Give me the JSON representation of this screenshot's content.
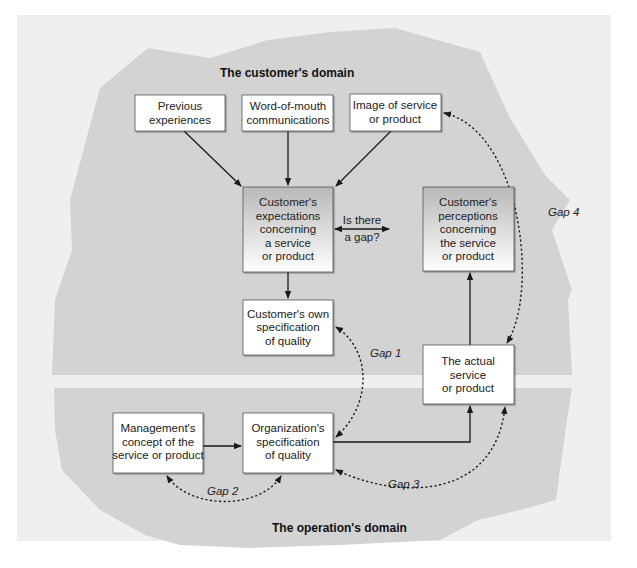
{
  "colors": {
    "page_background": "#ffffff",
    "panel_background": "#efefef",
    "domain_fill": "#d3d3d3",
    "separator": "#eaeaea",
    "box_fill": "#ffffff",
    "box_border": "#555555",
    "box_gradient_top": "#b9b9b9",
    "box_gradient_bottom": "#ffffff",
    "arrow": "#1a1a1a"
  },
  "domains": {
    "customer": {
      "title": "The customer's domain"
    },
    "operation": {
      "title": "The operation's domain"
    }
  },
  "boxes": {
    "previous_experiences": {
      "lines": [
        "Previous",
        "experiences"
      ]
    },
    "word_of_mouth": {
      "lines": [
        "Word-of-mouth",
        "communications"
      ]
    },
    "image_of_service": {
      "lines": [
        "Image of service",
        "or product"
      ]
    },
    "customer_expectations": {
      "lines": [
        "Customer's",
        "expectations",
        "concerning",
        "a service",
        "or product"
      ]
    },
    "customer_perceptions": {
      "lines": [
        "Customer's",
        "perceptions",
        "concerning",
        "the service",
        "or product"
      ]
    },
    "customer_own_spec": {
      "lines": [
        "Customer's own",
        "specification",
        "of quality"
      ]
    },
    "actual_service": {
      "lines": [
        "The actual",
        "service",
        "or product"
      ]
    },
    "management_concept": {
      "lines": [
        "Management's",
        "concept of the",
        "service or product"
      ]
    },
    "organization_spec": {
      "lines": [
        "Organization's",
        "specification",
        "of quality"
      ]
    }
  },
  "edge_labels": {
    "is_there_a_gap": [
      "Is there",
      "a gap?"
    ]
  },
  "gaps": {
    "gap1": "Gap 1",
    "gap2": "Gap 2",
    "gap3": "Gap 3",
    "gap4": "Gap 4"
  }
}
